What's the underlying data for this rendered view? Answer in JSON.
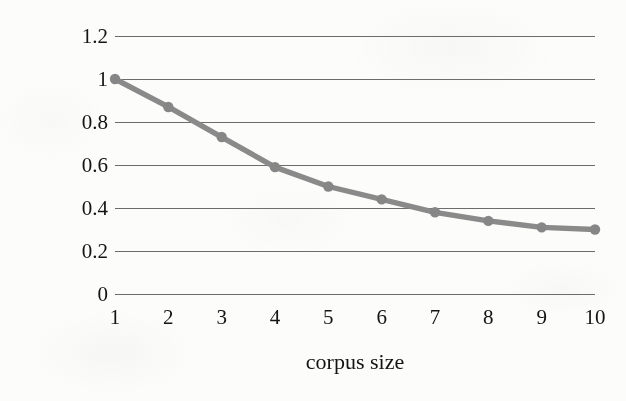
{
  "chart_data": {
    "type": "line",
    "title": "",
    "xlabel": "corpus size",
    "ylabel": "new relation type ratio",
    "x": [
      1,
      2,
      3,
      4,
      5,
      6,
      7,
      8,
      9,
      10
    ],
    "categories": [
      "1",
      "2",
      "3",
      "4",
      "5",
      "6",
      "7",
      "8",
      "9",
      "10"
    ],
    "values": [
      1.0,
      0.87,
      0.73,
      0.59,
      0.5,
      0.44,
      0.38,
      0.34,
      0.31,
      0.3
    ],
    "series": [
      {
        "name": "new relation type ratio",
        "values": [
          1.0,
          0.87,
          0.73,
          0.59,
          0.5,
          0.44,
          0.38,
          0.34,
          0.31,
          0.3
        ]
      }
    ],
    "ylim": [
      0,
      1.2
    ],
    "xlim": [
      1,
      10
    ],
    "yticks": [
      0,
      0.2,
      0.4,
      0.6,
      0.8,
      1.0,
      1.2
    ],
    "ytick_labels": [
      "0",
      "0.2",
      "0.4",
      "0.6",
      "0.8",
      "1",
      "1.2"
    ],
    "xticks": [
      1,
      2,
      3,
      4,
      5,
      6,
      7,
      8,
      9,
      10
    ],
    "xtick_labels": [
      "1",
      "2",
      "3",
      "4",
      "5",
      "6",
      "7",
      "8",
      "9",
      "10"
    ],
    "grid": "horizontal",
    "legend": "none",
    "marker": "circle",
    "colors": {
      "series_line": "#8a8a8a",
      "marker": "#868686",
      "gridline": "#5f5f5f",
      "text": "#141414",
      "background": "#fcfcfa"
    }
  }
}
